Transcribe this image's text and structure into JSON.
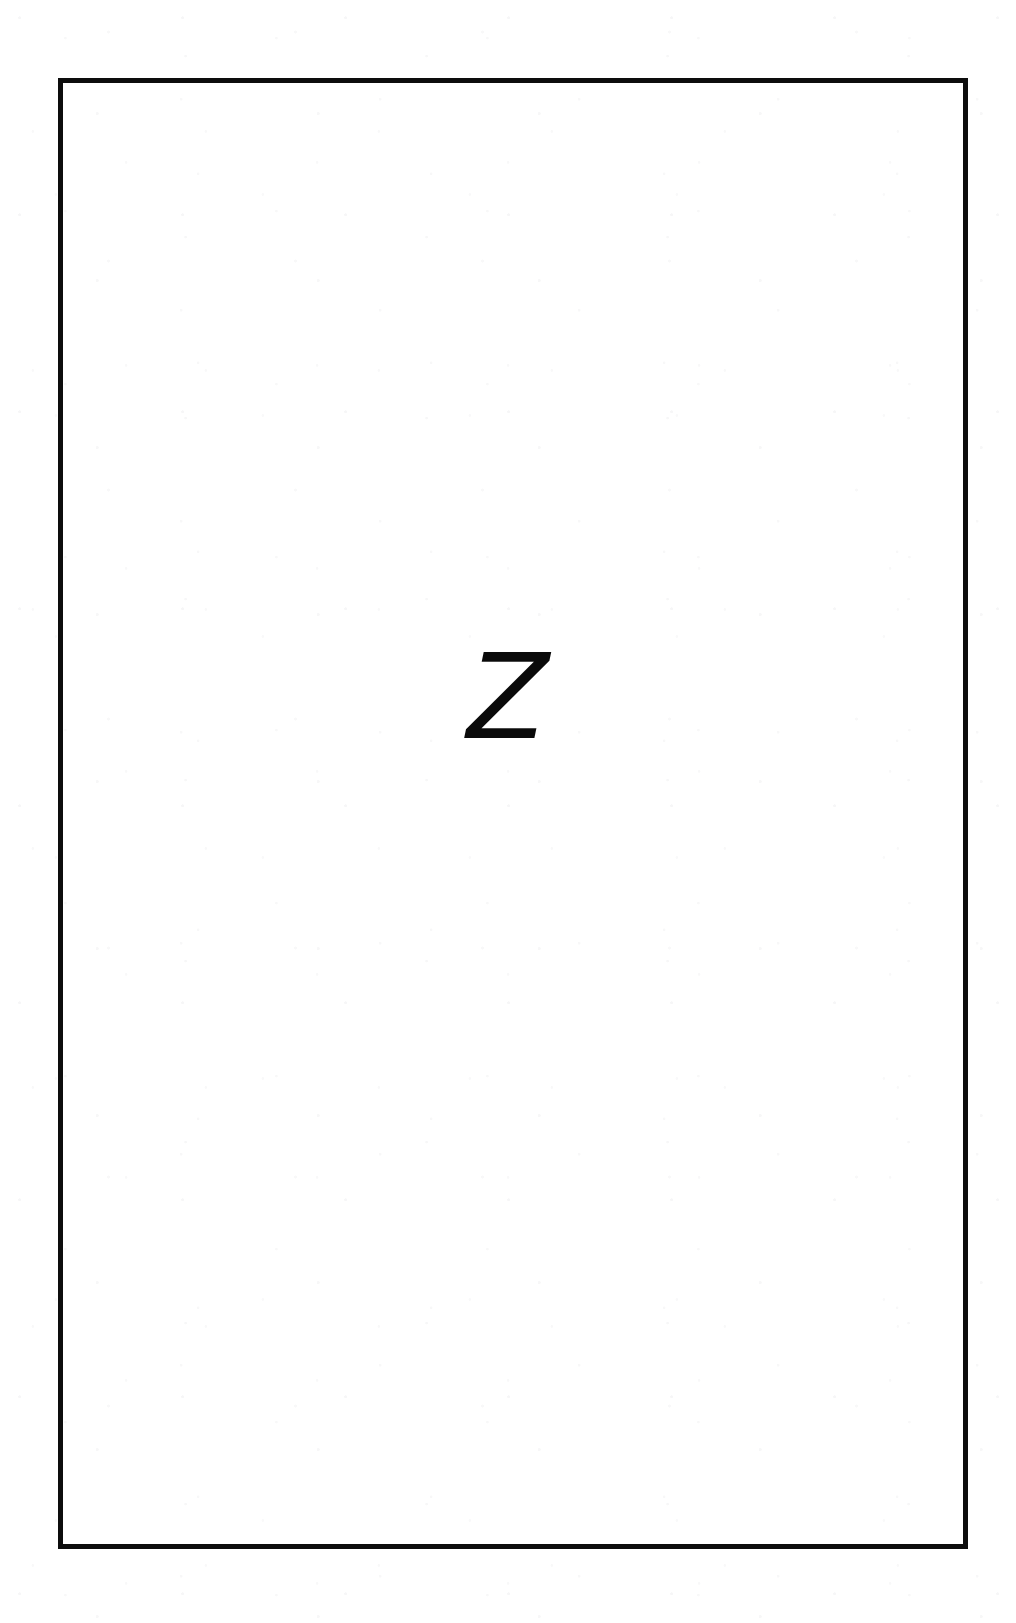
{
  "document": {
    "type": "scanned-page",
    "page_background_color": "#ffffff",
    "frame": {
      "name": "content-border",
      "stroke_color": "#0d0d0d",
      "stroke_width_px": 5,
      "left_px": 58,
      "top_px": 78,
      "width_px": 910,
      "height_px": 1471,
      "fill": "none"
    },
    "content": {
      "letter": "Z",
      "letter_color": "#0a0a0a",
      "letter_style": "oblique-sans-serif",
      "letter_cap_height_px": 84,
      "letter_center_x_px": 510,
      "letter_baseline_y_px": 802
    },
    "artifacts": {
      "texture": "faint grayscale scanner speckle",
      "texture_color": "#96969f"
    }
  }
}
